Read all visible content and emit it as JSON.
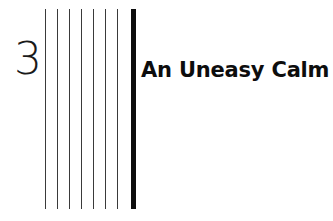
{
  "page": {
    "kind": "book-chapter-title-page",
    "background_color": "#ffffff",
    "width": 333,
    "height": 221
  },
  "chapter": {
    "number": "3",
    "title": "An Uneasy Calm",
    "number_color": "#1a1a1a",
    "title_color": "#0d0d0d"
  },
  "rules": {
    "thin_color": "#3a3a3a",
    "thick_color": "#0d0d0d",
    "top": 9,
    "bottom": 209,
    "thin_x": [
      45,
      57,
      69,
      81,
      93,
      105,
      117
    ],
    "thick_x": 131,
    "thick_width": 5,
    "count_thin": 7,
    "count_thick": 1
  }
}
